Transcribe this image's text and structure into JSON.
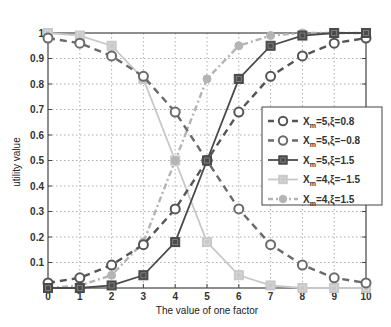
{
  "chart_data": {
    "type": "line",
    "title": "",
    "xlabel": "The value of one factor",
    "ylabel": "utility value",
    "xlim": [
      0,
      10
    ],
    "ylim": [
      0,
      1
    ],
    "grid": true,
    "legend_position": "center-right",
    "x": [
      0,
      1,
      2,
      3,
      4,
      5,
      6,
      7,
      8,
      9,
      10
    ],
    "x_ticks": [
      "0",
      "1",
      "2",
      "3",
      "4",
      "5",
      "6",
      "7",
      "8",
      "9",
      "10"
    ],
    "y_ticks": [
      "0.1",
      "0.2",
      "0.3",
      "0.4",
      "0.5",
      "0.6",
      "0.7",
      "0.8",
      "0.9",
      "1"
    ],
    "series": [
      {
        "name": "Xm=5,ξ=0.8",
        "legend_main": "X",
        "legend_sub": "m",
        "legend_rest": "=5,ξ=0.8",
        "color": "#555555",
        "line": "dashed",
        "marker": "circle-open",
        "values": [
          0.02,
          0.04,
          0.09,
          0.17,
          0.31,
          0.5,
          0.69,
          0.83,
          0.91,
          0.96,
          0.98
        ]
      },
      {
        "name": "Xm=5,ξ=-0.8",
        "legend_main": "X",
        "legend_sub": "m",
        "legend_rest": "=5,ξ=−0.8",
        "color": "#6a6a6a",
        "line": "dashed",
        "marker": "circle-open",
        "values": [
          0.98,
          0.96,
          0.91,
          0.83,
          0.69,
          0.5,
          0.31,
          0.17,
          0.09,
          0.04,
          0.02
        ]
      },
      {
        "name": "Xm=5,ξ=1.5",
        "legend_main": "X",
        "legend_sub": "m",
        "legend_rest": "=5,ξ=1.5",
        "color": "#4a4a4a",
        "line": "solid",
        "marker": "square",
        "values": [
          0.0,
          0.0,
          0.01,
          0.05,
          0.18,
          0.5,
          0.82,
          0.95,
          0.99,
          1.0,
          1.0
        ]
      },
      {
        "name": "Xm=4,ξ=-1.5",
        "legend_main": "X",
        "legend_sub": "m",
        "legend_rest": "=4,ξ=−1.5",
        "color": "#c8c8c8",
        "line": "solid",
        "marker": "square",
        "values": [
          1.0,
          0.99,
          0.95,
          0.82,
          0.5,
          0.18,
          0.05,
          0.01,
          0.0,
          0.0,
          0.0
        ]
      },
      {
        "name": "Xm=4,ξ=1.5",
        "legend_main": "X",
        "legend_sub": "m",
        "legend_rest": "=4,ξ=1.5",
        "color": "#b4b4b4",
        "line": "dashdot",
        "marker": "diamond",
        "values": [
          0.0,
          0.01,
          0.05,
          0.18,
          0.5,
          0.82,
          0.95,
          0.99,
          1.0,
          1.0,
          1.0
        ]
      }
    ]
  }
}
